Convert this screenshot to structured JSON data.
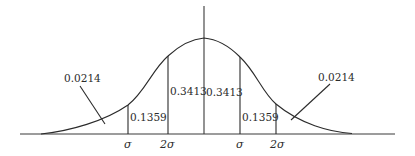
{
  "diagram": {
    "title": "",
    "type": "normal-distribution-areas",
    "baseline": {
      "x1": 20,
      "x2": 395,
      "y": 134
    },
    "center_axis": {
      "x": 204,
      "y_top": 6,
      "y_bottom": 134
    },
    "verticals": [
      {
        "id": "left-outer",
        "x": 128,
        "y_top": 105
      },
      {
        "id": "left-inner",
        "x": 168,
        "y_top": 56
      },
      {
        "id": "right-inner",
        "x": 240,
        "y_top": 57
      },
      {
        "id": "right-outer",
        "x": 276,
        "y_top": 104
      }
    ],
    "area_labels": {
      "left_tail": "0.0214",
      "left_outer_band": "0.1359",
      "left_inner_band": "0.3413",
      "right_inner_band": "0.3413",
      "right_outer_band": "0.1359",
      "right_tail": "0.0214"
    },
    "axis_labels": {
      "left_outer": "σ",
      "left_inner": "2σ",
      "right_inner": "σ",
      "right_outer": "2σ"
    },
    "leaders": [
      {
        "id": "left-tail-leader",
        "x1": 80,
        "y1": 86,
        "x2": 105,
        "y2": 124
      },
      {
        "id": "right-tail-leader",
        "x1": 330,
        "y1": 84,
        "x2": 291,
        "y2": 120
      }
    ],
    "colors": {
      "ink": "#2b2b2b",
      "background": "#ffffff"
    }
  }
}
